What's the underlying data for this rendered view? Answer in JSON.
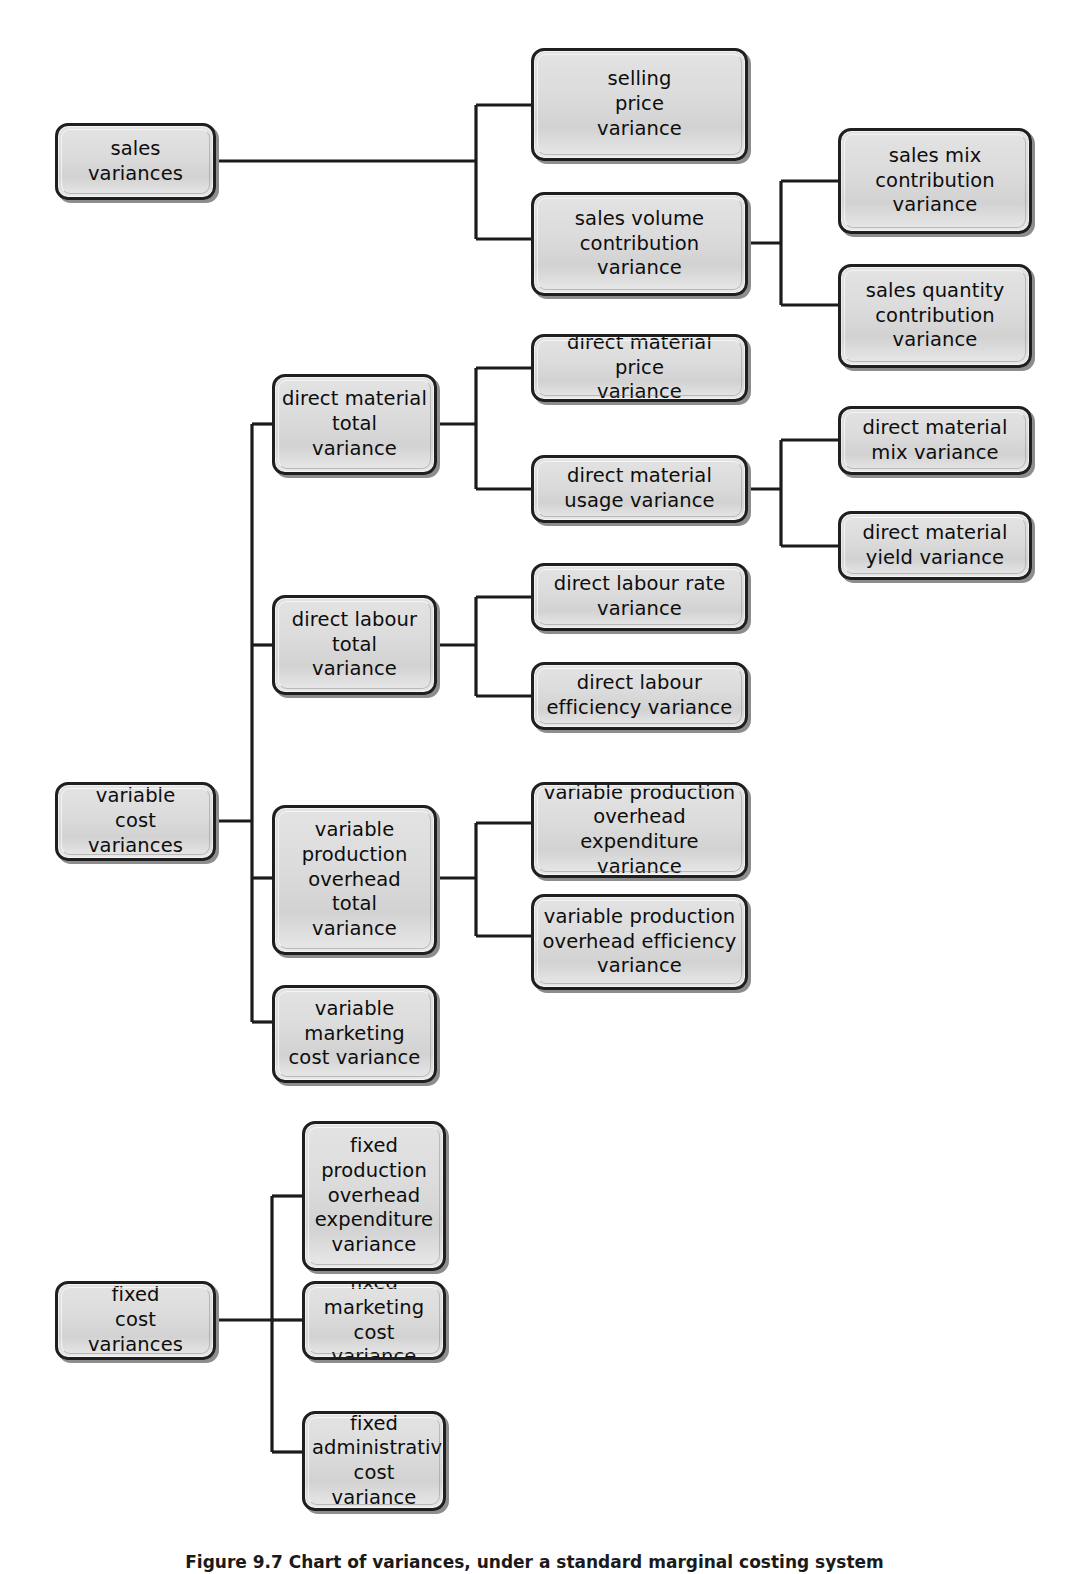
{
  "figure": {
    "caption": "Figure 9.7 Chart of variances, under a standard marginal costing system",
    "line_color": "#1b1b1b",
    "box_border_color": "#1f1f1f",
    "box_fill_color": "#dcdcdc",
    "box_shadow_color": "#8d8d8d",
    "background_color": "#ffffff",
    "type": "hierarchy-tree"
  },
  "nodes": {
    "sales_variances": {
      "label": "sales\nvariances"
    },
    "selling_price": {
      "label": "selling\nprice\nvariance"
    },
    "sales_volume_contribution": {
      "label": "sales volume\ncontribution\nvariance"
    },
    "sales_mix_contribution": {
      "label": "sales mix\ncontribution\nvariance"
    },
    "sales_quantity_contribution": {
      "label": "sales quantity\ncontribution\nvariance"
    },
    "variable_cost_variances": {
      "label": "variable\ncost\nvariances"
    },
    "dm_total": {
      "label": "direct material\ntotal\nvariance"
    },
    "dm_price": {
      "label": "direct material price\nvariance"
    },
    "dm_usage": {
      "label": "direct material\nusage variance"
    },
    "dm_mix": {
      "label": "direct material\nmix variance"
    },
    "dm_yield": {
      "label": "direct material\nyield variance"
    },
    "dl_total": {
      "label": "direct labour\ntotal\nvariance"
    },
    "dl_rate": {
      "label": "direct labour rate\nvariance"
    },
    "dl_efficiency": {
      "label": "direct labour\nefficiency variance"
    },
    "vpo_total": {
      "label": "variable\nproduction\noverhead\ntotal\nvariance"
    },
    "vpo_expenditure": {
      "label": "variable production\noverhead expenditure\nvariance"
    },
    "vpo_efficiency": {
      "label": "variable production\noverhead efficiency\nvariance"
    },
    "variable_marketing": {
      "label": "variable\nmarketing\ncost variance"
    },
    "fixed_cost_variances": {
      "label": "fixed\ncost\nvariances"
    },
    "fpo_expenditure": {
      "label": "fixed\nproduction\noverhead\nexpenditure\nvariance"
    },
    "fixed_marketing": {
      "label": "fixed\nmarketing\ncost variance"
    },
    "fixed_administrative": {
      "label": "fixed\nadministrative\ncost variance"
    }
  },
  "tree": {
    "roots": [
      "sales variances",
      "variable cost variances",
      "fixed cost variances"
    ],
    "edges": [
      {
        "from": "sales variances",
        "to": "selling price variance"
      },
      {
        "from": "sales variances",
        "to": "sales volume contribution variance"
      },
      {
        "from": "sales volume contribution variance",
        "to": "sales mix contribution variance"
      },
      {
        "from": "sales volume contribution variance",
        "to": "sales quantity contribution variance"
      },
      {
        "from": "variable cost variances",
        "to": "direct material total variance"
      },
      {
        "from": "variable cost variances",
        "to": "direct labour total variance"
      },
      {
        "from": "variable cost variances",
        "to": "variable production overhead total variance"
      },
      {
        "from": "variable cost variances",
        "to": "variable marketing cost variance"
      },
      {
        "from": "direct material total variance",
        "to": "direct material price variance"
      },
      {
        "from": "direct material total variance",
        "to": "direct material usage variance"
      },
      {
        "from": "direct material usage variance",
        "to": "direct material mix variance"
      },
      {
        "from": "direct material usage variance",
        "to": "direct material yield variance"
      },
      {
        "from": "direct labour total variance",
        "to": "direct labour rate variance"
      },
      {
        "from": "direct labour total variance",
        "to": "direct labour efficiency variance"
      },
      {
        "from": "variable production overhead total variance",
        "to": "variable production overhead expenditure variance"
      },
      {
        "from": "variable production overhead total variance",
        "to": "variable production overhead efficiency variance"
      },
      {
        "from": "fixed cost variances",
        "to": "fixed production overhead expenditure variance"
      },
      {
        "from": "fixed cost variances",
        "to": "fixed marketing cost variance"
      },
      {
        "from": "fixed cost variances",
        "to": "fixed administrative cost variance"
      }
    ]
  }
}
